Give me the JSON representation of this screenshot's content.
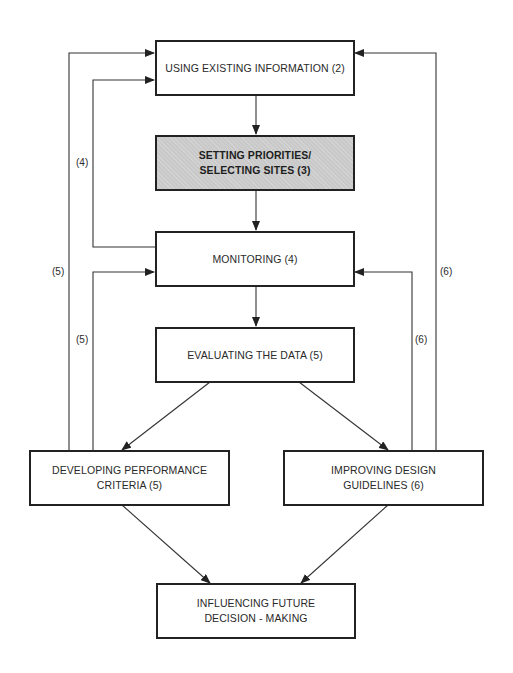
{
  "diagram": {
    "type": "flowchart",
    "nodes": [
      {
        "id": "using-existing-information",
        "label": "USING EXISTING INFORMATION (2)",
        "shaded": false
      },
      {
        "id": "setting-priorities",
        "label": "SETTING PRIORITIES/\nSELECTING SITES (3)",
        "shaded": true
      },
      {
        "id": "monitoring",
        "label": "MONITORING (4)",
        "shaded": false
      },
      {
        "id": "evaluating-the-data",
        "label": "EVALUATING THE DATA (5)",
        "shaded": false
      },
      {
        "id": "developing-performance-criteria",
        "label": "DEVELOPING PERFORMANCE\nCRITERIA (5)",
        "shaded": false
      },
      {
        "id": "improving-design-guidelines",
        "label": "IMPROVING DESIGN\nGUIDELINES (6)",
        "shaded": false
      },
      {
        "id": "influencing-future-decision-making",
        "label": "INFLUENCING FUTURE\nDECISION - MAKING",
        "shaded": false
      }
    ],
    "edges": [
      {
        "from": "using-existing-information",
        "to": "setting-priorities",
        "label": ""
      },
      {
        "from": "setting-priorities",
        "to": "monitoring",
        "label": ""
      },
      {
        "from": "monitoring",
        "to": "evaluating-the-data",
        "label": ""
      },
      {
        "from": "evaluating-the-data",
        "to": "developing-performance-criteria",
        "label": ""
      },
      {
        "from": "evaluating-the-data",
        "to": "improving-design-guidelines",
        "label": ""
      },
      {
        "from": "developing-performance-criteria",
        "to": "influencing-future-decision-making",
        "label": ""
      },
      {
        "from": "improving-design-guidelines",
        "to": "influencing-future-decision-making",
        "label": ""
      },
      {
        "from": "monitoring",
        "to": "using-existing-information",
        "label": "(4)"
      },
      {
        "from": "developing-performance-criteria",
        "to": "using-existing-information",
        "label": "(5)"
      },
      {
        "from": "developing-performance-criteria",
        "to": "monitoring",
        "label": "(5)"
      },
      {
        "from": "improving-design-guidelines",
        "to": "using-existing-information",
        "label": "(6)"
      },
      {
        "from": "improving-design-guidelines",
        "to": "monitoring",
        "label": "(6)"
      }
    ],
    "edge_labels": {
      "feedback_monitoring_to_using": "(4)",
      "feedback_developing_to_using": "(5)",
      "feedback_developing_to_monitoring": "(5)",
      "feedback_improving_to_using": "(6)",
      "feedback_improving_to_monitoring": "(6)"
    },
    "colors": {
      "line": "#333333",
      "box_border": "#222222",
      "shaded_fill": "#c9c9c9",
      "text": "#2a2a2a"
    }
  }
}
